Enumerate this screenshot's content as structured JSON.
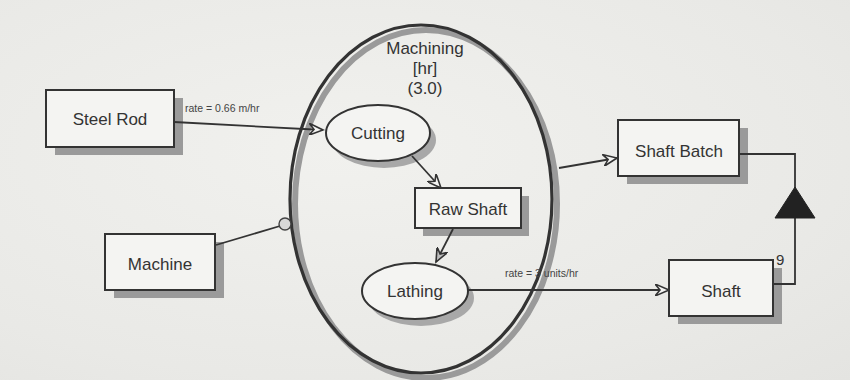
{
  "diagram": {
    "process": {
      "name": "Machining",
      "unit": "[hr]",
      "duration": "(3.0)"
    },
    "objects": {
      "steel_rod": "Steel Rod",
      "machine": "Machine",
      "raw_shaft": "Raw Shaft",
      "shaft_batch": "Shaft Batch",
      "shaft": "Shaft"
    },
    "subprocesses": {
      "cutting": "Cutting",
      "lathing": "Lathing"
    },
    "links": {
      "steel_rod_to_cutting_rate": "rate = 0.66 m/hr",
      "lathing_to_shaft_rate": "rate = 3 units/hr",
      "shaft_aggregation_multiplicity": "9"
    },
    "colors": {
      "stroke": "#333333",
      "shadow": "#9a9a9a",
      "fill": "#f4f4f2",
      "background": "#ebebe8"
    }
  }
}
